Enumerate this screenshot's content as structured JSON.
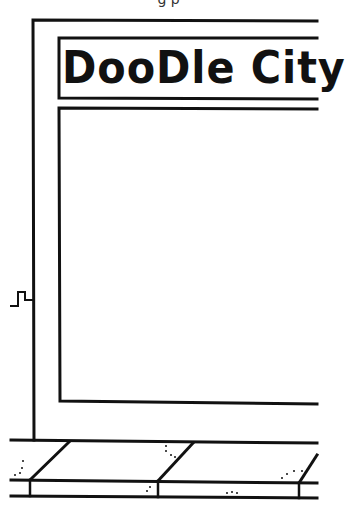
{
  "page": {
    "type": "coloring-page",
    "top_caption": "g   p"
  },
  "storefront": {
    "sign_text": "DooDle City",
    "stroke_color": "#111111",
    "background_color": "#ffffff"
  },
  "sidewalk": {
    "slab_count": 3,
    "has_speckles": true
  }
}
